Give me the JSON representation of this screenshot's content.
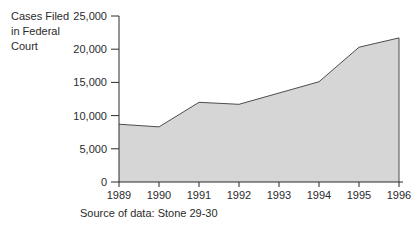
{
  "ylabel_lines": [
    "Cases Filed",
    "in Federal",
    "Court"
  ],
  "source_note": "Source of data: Stone 29-30",
  "chart_data": {
    "type": "area",
    "title": "",
    "xlabel": "",
    "ylabel": "Cases Filed in Federal Court",
    "categories": [
      "1989",
      "1990",
      "1991",
      "1992",
      "1993",
      "1994",
      "1995",
      "1996"
    ],
    "values": [
      8700,
      8300,
      12000,
      11700,
      13400,
      15100,
      20300,
      21700
    ],
    "ylim": [
      0,
      25000
    ],
    "ytick_step": 5000,
    "ytick_labels": [
      "0",
      "5,000",
      "10,000",
      "15,000",
      "20,000",
      "25,000"
    ],
    "grid": "off",
    "legend": "none",
    "fill_color": "#d6d6d6",
    "line_color": "#4d4d4d",
    "axis_color": "#2b2b2b",
    "text_color": "#2b2b2b"
  }
}
